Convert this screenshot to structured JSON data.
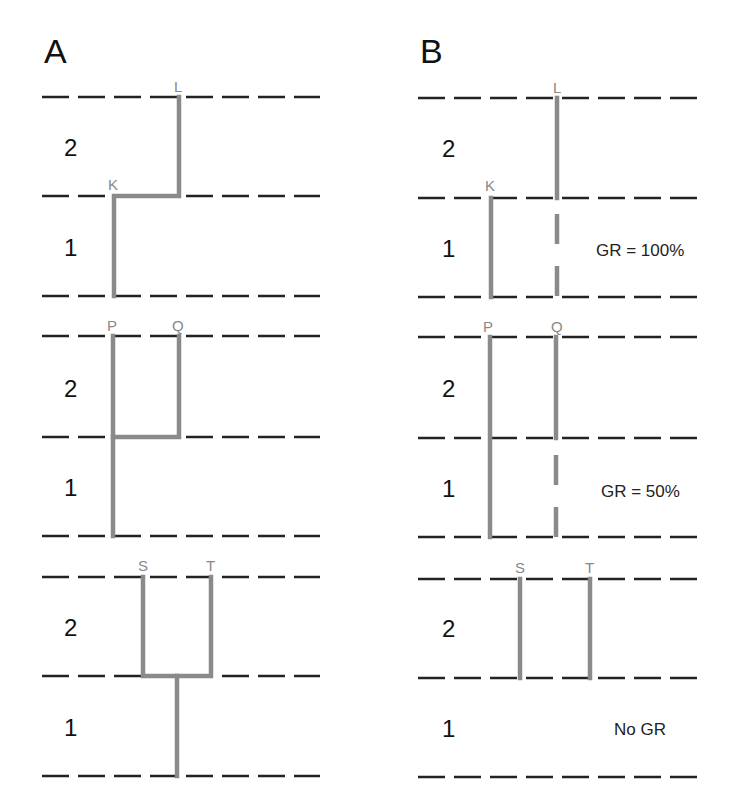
{
  "panels": [
    {
      "id": "A",
      "label": "A"
    },
    {
      "id": "B",
      "label": "B"
    }
  ],
  "layers": {
    "upper": "2",
    "lower": "1"
  },
  "rows": [
    {
      "row": 1,
      "nodes": [
        "K",
        "L"
      ],
      "A": {
        "description": "K in layer 1 connects up via horizontal link to L spanning layer 2"
      },
      "B": {
        "gr_label": "GR = 100%",
        "description": "K spans layer 1; L spans layer 2 and extends into layer 1 as dashed line"
      }
    },
    {
      "row": 2,
      "nodes": [
        "P",
        "Q"
      ],
      "A": {
        "description": "P spans layers 1 and 2; Q in layer 2 joined to P at layer boundary"
      },
      "B": {
        "gr_label": "GR = 50%",
        "description": "P spans layers 1 and 2; Q spans layer 2 with dashed extension into layer 1"
      }
    },
    {
      "row": 3,
      "nodes": [
        "S",
        "T"
      ],
      "A": {
        "description": "S and T in layer 2 joined at boundary, single trunk down through layer 1"
      },
      "B": {
        "gr_label": "No GR",
        "description": "S and T span layer 2 only"
      }
    }
  ],
  "colors": {
    "dashed_line": "#222222",
    "path": "#8a8a8a",
    "node_label": "#888888",
    "text": "#111111"
  }
}
